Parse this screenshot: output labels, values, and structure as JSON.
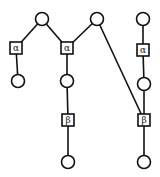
{
  "diagram": {
    "colors": {
      "stroke": "#111111",
      "fill": "#ffffff"
    },
    "nodes": [
      {
        "id": "c1",
        "type": "circle",
        "x": 42,
        "y": 19
      },
      {
        "id": "c2",
        "type": "circle",
        "x": 97,
        "y": 19
      },
      {
        "id": "c3",
        "type": "circle",
        "x": 143,
        "y": 19
      },
      {
        "id": "a1",
        "type": "box",
        "label": "α",
        "x": 16,
        "y": 48
      },
      {
        "id": "a2",
        "type": "box",
        "label": "α",
        "x": 67,
        "y": 48
      },
      {
        "id": "a3",
        "type": "box",
        "label": "α",
        "x": 143,
        "y": 50
      },
      {
        "id": "c4",
        "type": "circle",
        "x": 18,
        "y": 81
      },
      {
        "id": "c5",
        "type": "circle",
        "x": 67,
        "y": 81
      },
      {
        "id": "c6",
        "type": "circle",
        "x": 144,
        "y": 84
      },
      {
        "id": "b1",
        "type": "box",
        "label": "β",
        "x": 68,
        "y": 120
      },
      {
        "id": "b2",
        "type": "box",
        "label": "β",
        "x": 144,
        "y": 120
      },
      {
        "id": "c7",
        "type": "circle",
        "x": 68,
        "y": 162
      },
      {
        "id": "c8",
        "type": "circle",
        "x": 144,
        "y": 162
      }
    ],
    "edges": [
      [
        "c1",
        "a1"
      ],
      [
        "c1",
        "a2"
      ],
      [
        "c2",
        "a2"
      ],
      [
        "c2",
        "b2"
      ],
      [
        "a1",
        "c4"
      ],
      [
        "a2",
        "c5"
      ],
      [
        "c5",
        "b1"
      ],
      [
        "b1",
        "c7"
      ],
      [
        "c3",
        "a3"
      ],
      [
        "a3",
        "c6"
      ],
      [
        "c6",
        "b2"
      ],
      [
        "b2",
        "c8"
      ]
    ]
  }
}
